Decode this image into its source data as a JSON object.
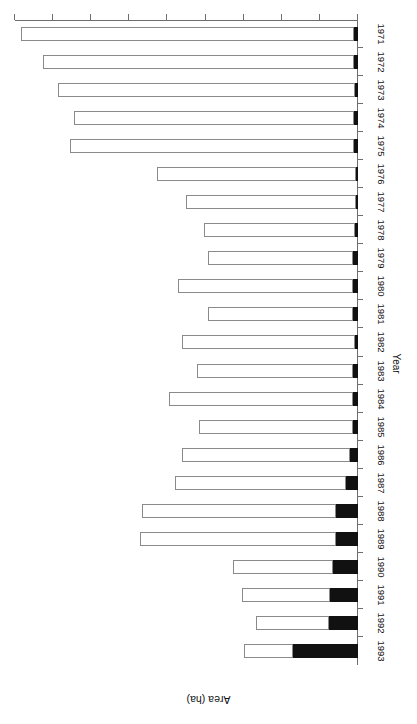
{
  "chart_data": {
    "type": "bar",
    "orientation": "horizontal",
    "title": "",
    "xlabel": "Area (ha)",
    "ylabel": "Year",
    "xlim": [
      0,
      45000
    ],
    "xticks": [
      0,
      5000,
      10000,
      15000,
      20000,
      25000,
      30000,
      35000,
      40000,
      45000
    ],
    "xticklabels": [
      "0",
      "5 000",
      "10 000",
      "15 000",
      "20 000",
      "25 000",
      "30 000",
      "35 000",
      "40 000",
      "45 000"
    ],
    "grid": false,
    "legend": false,
    "stacked": true,
    "categories": [
      "1971",
      "1972",
      "1973",
      "1974",
      "1975",
      "1976",
      "1977",
      "1978",
      "1979",
      "1980",
      "1981",
      "1982",
      "1983",
      "1984",
      "1985",
      "1986",
      "1987",
      "1988",
      "1989",
      "1990",
      "1991",
      "1992",
      "1993"
    ],
    "series": [
      {
        "name": "black-segment",
        "color": "#111111",
        "values": [
          530,
          530,
          430,
          530,
          530,
          300,
          300,
          430,
          600,
          600,
          600,
          430,
          600,
          660,
          660,
          1000,
          1520,
          2910,
          2950,
          3260,
          3720,
          3800,
          8530
        ]
      },
      {
        "name": "white-segment",
        "color": "#ffffff",
        "values": [
          43720,
          40820,
          38970,
          36670,
          37220,
          26100,
          22250,
          19820,
          19100,
          23050,
          19100,
          22670,
          20500,
          24190,
          20140,
          22100,
          22480,
          25490,
          25700,
          13140,
          11460,
          9540,
          6370
        ]
      }
    ],
    "totals": [
      44250,
      41350,
      39400,
      37200,
      37750,
      26400,
      22550,
      20250,
      19700,
      23650,
      19700,
      23100,
      21100,
      24850,
      20800,
      23100,
      24000,
      28400,
      28650,
      16400,
      15180,
      13340,
      14900
    ]
  }
}
